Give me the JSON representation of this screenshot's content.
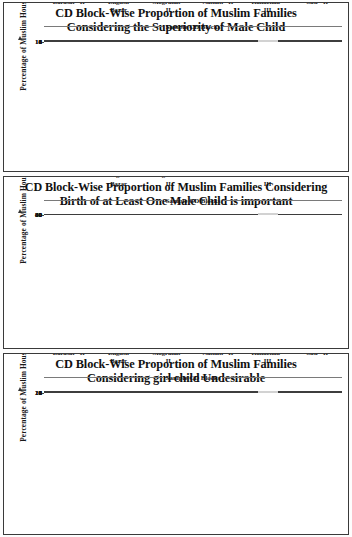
{
  "figure": {
    "axis_caption_y": "Percentage of Muslim Households",
    "axis_caption_x": "Sample CD Blocks",
    "categories": [
      "Barasat - II",
      "English Bazar",
      "Mograhat - II",
      "Nalhati - II",
      "Kaliachak - III",
      "Suti - II"
    ],
    "colors": {
      "bar_dark": "#4a4a4a",
      "bar_medium": "#7a7a7a",
      "bar_light": "#e9e9e9",
      "axis": "#3d3d3d",
      "text": "#111111",
      "panel_border": "#3a3a3a"
    }
  },
  "chart_data": [
    {
      "type": "bar",
      "title": "CD Block-Wise Proportion of Muslim Families Considering the Superiority of Male Child",
      "title_line1": "CD Block-Wise Proportion of Muslim Families",
      "title_line2": "Considering the Superiority of Male Child",
      "xlabel": "Sample CD Blocks",
      "ylabel": "Percentage of Muslim Households",
      "categories": [
        "Barasat - II",
        "English Bazar",
        "Mograhat - II",
        "Nalhati - II",
        "Kaliachak - III",
        "Suti - II"
      ],
      "values": [
        2,
        5,
        8,
        2,
        9,
        15
      ],
      "bar_colors": [
        "#4a4a4a",
        "#4a4a4a",
        "#4a4a4a",
        "#7a7a7a",
        "#e9e9e9",
        "#3f3f3f"
      ],
      "ylim": [
        0,
        16
      ],
      "yticks": [
        0,
        4,
        8,
        12,
        16
      ],
      "grid": false,
      "legend": "none"
    },
    {
      "type": "bar",
      "title": "CD Block-Wise Proportion of Muslim Families Considering Birth of  at Least One Male Child is important",
      "title_line1": "CD Block-Wise Proportion of Muslim Families Considering",
      "title_line2": "Birth of  at Least One Male Child is important",
      "xlabel": "Sample CD Blocks",
      "ylabel": "Percentage of Muslim Households",
      "categories": [
        "Barasat - II",
        "English Bazar",
        "Mograhat - II",
        "Nalhati - II",
        "Kaliachak - III",
        "Suti - II"
      ],
      "values": [
        55,
        48,
        66,
        21,
        73,
        76
      ],
      "bar_colors": [
        "#4a4a4a",
        "#4a4a4a",
        "#4a4a4a",
        "#7a7a7a",
        "#e9e9e9",
        "#3f3f3f"
      ],
      "ylim": [
        0,
        80
      ],
      "yticks": [
        0,
        20,
        40,
        60,
        80
      ],
      "grid": false,
      "legend": "none"
    },
    {
      "type": "bar",
      "title": "CD Block-Wise Proportion of Muslim Families Considering girl child Undesirable",
      "title_line1": "CD Block-Wise Proportion of Muslim Families",
      "title_line2": "Considering girl child Undesirable",
      "xlabel": "Sample CD Blocks",
      "ylabel": "Percentage of Muslim Households",
      "categories": [
        "Barasat - II",
        "English Bazar",
        "Mograhat - II",
        "Nalhati - II",
        "Kaliachak - III",
        "Suti - II"
      ],
      "values": [
        6,
        8,
        20,
        2.5,
        9,
        13
      ],
      "bar_colors": [
        "#4a4a4a",
        "#4a4a4a",
        "#4a4a4a",
        "#7a7a7a",
        "#e9e9e9",
        "#3f3f3f"
      ],
      "ylim": [
        0,
        20
      ],
      "yticks": [
        0,
        4,
        8,
        12,
        16,
        20
      ],
      "grid": false,
      "legend": "none"
    }
  ]
}
